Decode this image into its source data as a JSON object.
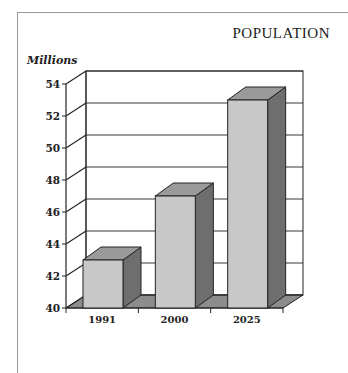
{
  "chart_data": {
    "type": "bar",
    "title": "POPULATION",
    "xlabel": "",
    "ylabel": "Millions",
    "categories": [
      "1991",
      "2000",
      "2025"
    ],
    "values": [
      43,
      47,
      53
    ],
    "ylim": [
      40,
      54
    ],
    "yticks": [
      "40",
      "42",
      "44",
      "46",
      "48",
      "50",
      "52",
      "54"
    ],
    "grid": true,
    "style": "3d",
    "legend": null,
    "colors": {
      "bar_front": "#c8c8c8",
      "bar_top": "#9a9a9a",
      "bar_side": "#6e6e6e",
      "floor": "#8c8c8c"
    }
  }
}
